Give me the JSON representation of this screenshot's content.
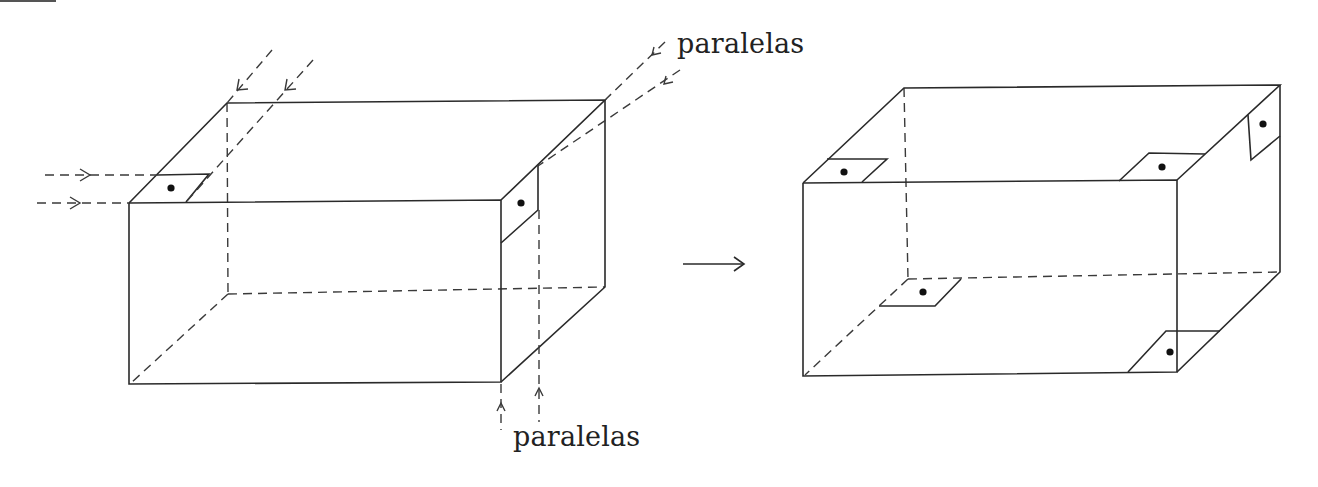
{
  "figure": {
    "labels": {
      "top_right": "paralelas",
      "bottom": "paralelas"
    },
    "left_box": {
      "description": "rectangular box with parallel projection arrows indicating folds at corners",
      "front_face": [
        [
          129,
          203
        ],
        [
          501,
          200
        ],
        [
          501,
          382
        ],
        [
          129,
          384
        ]
      ],
      "back_face": [
        [
          227,
          103
        ],
        [
          605,
          100
        ],
        [
          605,
          287
        ],
        [
          227,
          294
        ]
      ],
      "corner_tabs": 2
    },
    "transform_arrow": "→",
    "right_box": {
      "description": "box with folded corner tabs marked with dots",
      "front_face": [
        [
          803,
          183
        ],
        [
          1177,
          180
        ],
        [
          1177,
          372
        ],
        [
          803,
          376
        ]
      ],
      "back_face": [
        [
          903,
          88
        ],
        [
          1280,
          85
        ],
        [
          1280,
          272
        ],
        [
          908,
          279
        ]
      ],
      "corner_tabs": 4
    },
    "colors": {
      "line": "#2a2a2a",
      "background": "#ffffff"
    }
  }
}
